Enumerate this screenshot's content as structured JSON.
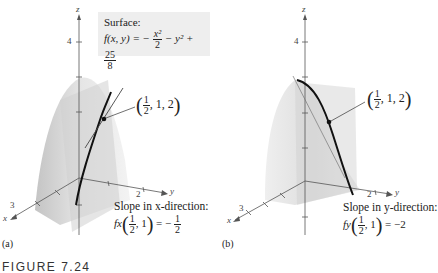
{
  "figure": {
    "caption": "FIGURE 7.24",
    "surface_box": {
      "title": "Surface:",
      "lhs": "f(x, y) = −",
      "term1_num": "x²",
      "term1_den": "2",
      "middle": "− y² +",
      "term2_num": "25",
      "term2_den": "8"
    },
    "panels": [
      {
        "id": "a",
        "sub_label": "(a)",
        "point_label": {
          "num": "1",
          "den": "2",
          "rest": ", 1, 2"
        },
        "slope_title": "Slope in x-direction:",
        "slope_lhs": "fx",
        "slope_arg_num": "1",
        "slope_arg_den": "2",
        "slope_arg_rest": ", 1",
        "slope_eq": "= −",
        "slope_val_num": "1",
        "slope_val_den": "2",
        "axes": {
          "z": "z",
          "x": "x",
          "y": "y",
          "z_tick": "4",
          "x_tick": "3",
          "y_tick": "2"
        }
      },
      {
        "id": "b",
        "sub_label": "(b)",
        "point_label": {
          "num": "1",
          "den": "2",
          "rest": ", 1, 2"
        },
        "slope_title": "Slope in y-direction:",
        "slope_lhs": "fy",
        "slope_arg_num": "1",
        "slope_arg_den": "2",
        "slope_arg_rest": ", 1",
        "slope_eq": "= −2",
        "axes": {
          "z": "z",
          "x": "x",
          "y": "y",
          "z_tick": "4",
          "x_tick": "3",
          "y_tick": "2"
        }
      }
    ],
    "colors": {
      "surface": "#d9d9d9",
      "plane": "#c8c8c8",
      "curve": "#111111",
      "box": "#eeeeee"
    }
  }
}
